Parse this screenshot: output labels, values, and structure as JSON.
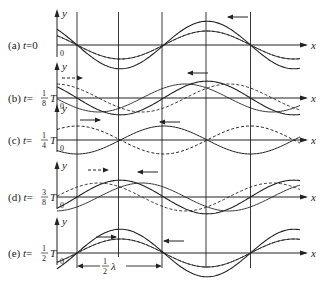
{
  "figure": {
    "axis_labels": {
      "y": "y",
      "x": "x",
      "origin": "0"
    },
    "panels": [
      {
        "id": "a",
        "label_prefix": "(a) ",
        "label_t": "t",
        "label_eq": "=0",
        "frac": null,
        "frac_suffix": "",
        "phase": 0.0
      },
      {
        "id": "b",
        "label_prefix": "(b) ",
        "label_t": "t",
        "label_eq": "=",
        "frac": {
          "num": "1",
          "den": "8"
        },
        "frac_suffix": "T",
        "phase": 0.125
      },
      {
        "id": "c",
        "label_prefix": "(c) ",
        "label_t": "t",
        "label_eq": "=",
        "frac": {
          "num": "1",
          "den": "4"
        },
        "frac_suffix": "T",
        "phase": 0.25
      },
      {
        "id": "d",
        "label_prefix": "(d) ",
        "label_t": "t",
        "label_eq": "=",
        "frac": {
          "num": "3",
          "den": "8"
        },
        "frac_suffix": "T",
        "phase": 0.375
      },
      {
        "id": "e",
        "label_prefix": "(e) ",
        "label_t": "t",
        "label_eq": "=",
        "frac": {
          "num": "1",
          "den": "2"
        },
        "frac_suffix": "T",
        "phase": 0.5
      }
    ],
    "wavelength_annotation": {
      "num": "1",
      "den": "2",
      "symbol": "λ"
    },
    "legend": {
      "solid_thin": "traveling wave components",
      "dashed": "rightward-traveling wave",
      "solid_thick": "resultant standing wave"
    },
    "colors": {
      "line": "#222222",
      "background": "#ffffff"
    }
  }
}
